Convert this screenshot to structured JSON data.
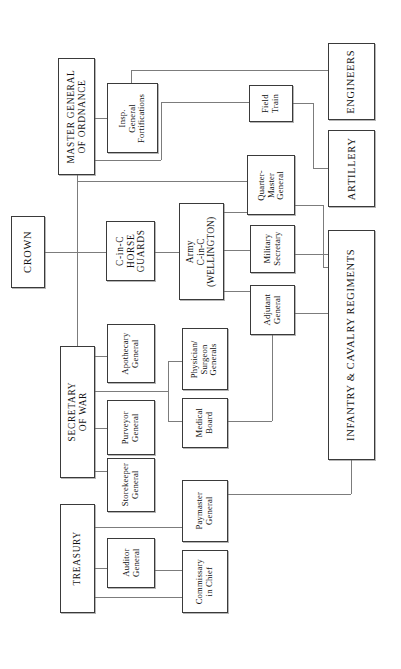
{
  "diagram": {
    "orientation": "rotated-90-ccw",
    "line_color": "#7c7c7c",
    "box_border_color": "#3a3a3a",
    "background": "#ffffff"
  },
  "nodes": {
    "crown": "CROWN",
    "master_general_of_ordnance": "MASTER GENERAL\nOF ORDNANCE",
    "insp_general_fortifications": "Insp.\nGeneral\nFortifications",
    "field_train": "Field\nTrain",
    "engineers": "ENGINEERS",
    "artillery": "ARTILLERY",
    "infantry_cavalry": "INFANTRY & CAVALRY REGIMENTS",
    "cinc_horse_guards": "C-in-C\nHORSE\nGUARDS",
    "army_cinc": "Army\nC-in-C\n(WELLINGTON)",
    "quarter_master_general": "Quarter-\nMaster\nGeneral",
    "military_secretary": "Military\nSecretary",
    "adjutant_general": "Adjutant\nGeneral",
    "secretary_of_war": "SECRETARY\nOF WAR",
    "apothecary_general": "Apothecary\nGeneral",
    "purveyor_general": "Purveyor\nGeneral",
    "storekeeper_general": "Storekeeper\nGeneral",
    "physician_surgeon_generals": "Physician/\nSurgeon\nGenerals",
    "medical_board": "Medical\nBoard",
    "treasury": "TREASURY",
    "auditor_general": "Auditor\nGeneral",
    "paymaster_general": "Paymaster\nGeneral",
    "commissary_in_chief": "Commissary\nin Chief"
  }
}
